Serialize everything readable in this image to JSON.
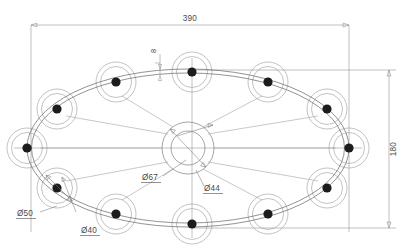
{
  "drawing": {
    "title": "Ring truss assembly plan view",
    "type": "engineering-drawing",
    "units": "mm",
    "canvas": {
      "width": 416,
      "height": 246
    },
    "background_color": "#ffffff",
    "line_color": "#8d8d8d",
    "text_color": "#4a4a4a",
    "node_fill_color": "#1c1c1c"
  },
  "dimensions": [
    {
      "id": "overall-width",
      "label": "390",
      "orientation": "horizontal",
      "value": 390,
      "position": {
        "x": 190,
        "y": 19
      },
      "line": {
        "x1": 31,
        "y1": 25,
        "x2": 349,
        "y2": 25
      }
    },
    {
      "id": "overall-height",
      "label": "180",
      "orientation": "vertical",
      "value": 180,
      "position": {
        "x": 393,
        "y": 149
      },
      "line": {
        "x1": 389,
        "y1": 70,
        "x2": 389,
        "y2": 228
      }
    },
    {
      "id": "rail-thickness",
      "label": "8",
      "orientation": "vertical",
      "value": 8,
      "position": {
        "x": 156,
        "y": 50
      },
      "line": {
        "x1": 160,
        "y1": 53,
        "x2": 160,
        "y2": 74
      }
    }
  ],
  "diameter_callouts": [
    {
      "id": "hub-outer",
      "label": "Ø67",
      "value": 67,
      "text_position": {
        "x": 142,
        "y": 178
      },
      "leader": {
        "x1": 163,
        "y1": 175,
        "x2": 186,
        "y2": 160
      },
      "underlined": true
    },
    {
      "id": "hub-inner",
      "label": "Ø44",
      "value": 44,
      "text_position": {
        "x": 205,
        "y": 189
      },
      "leader": {
        "x1": 204,
        "y1": 186,
        "x2": 196,
        "y2": 168
      },
      "underlined": true
    },
    {
      "id": "node-outer",
      "label": "Ø50",
      "value": 50,
      "text_position": {
        "x": 18,
        "y": 214
      },
      "leader": {
        "x1": 40,
        "y1": 211,
        "x2": 57,
        "y2": 205
      },
      "underlined": true
    },
    {
      "id": "node-inner",
      "label": "Ø40",
      "value": 40,
      "text_position": {
        "x": 82,
        "y": 231
      },
      "leader": {
        "x1": 81,
        "y1": 227,
        "x2": 72,
        "y2": 208
      },
      "underlined": true
    }
  ],
  "geometry": {
    "ellipse_center": {
      "cx": 188,
      "cy": 148
    },
    "ellipse_outer": {
      "rx": 161,
      "ry": 79
    },
    "ellipse_inner": {
      "rx": 157,
      "ry": 75.5
    },
    "hub": {
      "cx": 188,
      "cy": 148,
      "outer_r": 26,
      "inner_r": 17,
      "label_outer": "Ø67",
      "label_inner": "Ø44"
    },
    "node_count": 12,
    "node_outer_r": 20,
    "node_mid_r": 16,
    "node_dot_r": 4.6,
    "nodes": [
      {
        "index": 0,
        "angle_deg": 0,
        "cx": 349,
        "cy": 148
      },
      {
        "index": 1,
        "angle_deg": 30,
        "cx": 327,
        "cy": 109
      },
      {
        "index": 2,
        "angle_deg": 60,
        "cx": 268,
        "cy": 82
      },
      {
        "index": 3,
        "angle_deg": 90,
        "cx": 192,
        "cy": 72
      },
      {
        "index": 4,
        "angle_deg": 120,
        "cx": 116,
        "cy": 82
      },
      {
        "index": 5,
        "angle_deg": 150,
        "cx": 57,
        "cy": 109
      },
      {
        "index": 6,
        "angle_deg": 180,
        "cx": 27,
        "cy": 148
      },
      {
        "index": 7,
        "angle_deg": 210,
        "cx": 57,
        "cy": 188
      },
      {
        "index": 8,
        "angle_deg": 240,
        "cx": 116,
        "cy": 214
      },
      {
        "index": 9,
        "angle_deg": 270,
        "cx": 192,
        "cy": 224
      },
      {
        "index": 10,
        "angle_deg": 300,
        "cx": 268,
        "cy": 214
      },
      {
        "index": 11,
        "angle_deg": 330,
        "cx": 327,
        "cy": 188
      }
    ],
    "spokes_from_hub_to_node_index": [
      0,
      1,
      2,
      4,
      5,
      6,
      7,
      8,
      10,
      11
    ],
    "centerlines": {
      "horizontal": {
        "x1": 14,
        "y1": 148,
        "x2": 362,
        "y2": 148
      },
      "vertical": {
        "x1": 192,
        "y1": 58,
        "x2": 192,
        "y2": 238
      }
    }
  }
}
